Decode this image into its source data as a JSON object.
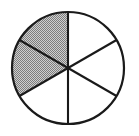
{
  "figure": {
    "name": "fraction-circle",
    "shape": "circle",
    "background_color": "#ffffff",
    "outline_color": "#1a1a1a",
    "outline_width_px": 2.2,
    "divider_color": "#1a1a1a",
    "divider_width_px": 2.1,
    "shaded_fill_color": "#a0a0a0",
    "shaded_fill_style": "dithered-checkerboard-gray",
    "unshaded_fill_color": "#ffffff"
  },
  "chart_data": {
    "type": "pie",
    "title": "",
    "subtitle": "",
    "xlabel": "",
    "ylabel": "",
    "legend_position": "none",
    "grid": false,
    "center_x": 68,
    "center_y": 68,
    "radius": 56,
    "total_sectors": 6,
    "shaded_sectors": 2,
    "unshaded_sectors": 4,
    "fraction_shaded": "2/6",
    "sector_angle_degrees": 60,
    "categories": [
      "sector-1",
      "sector-2",
      "sector-3",
      "sector-4",
      "sector-5",
      "sector-6"
    ],
    "values": [
      1,
      1,
      1,
      1,
      1,
      1
    ],
    "series": [
      {
        "name": "sectors",
        "values": [
          1,
          1,
          1,
          1,
          1,
          1
        ]
      }
    ],
    "sectors": [
      {
        "id": "sector-1",
        "position": "top-left",
        "start_angle_degrees": 90,
        "end_angle_degrees": 150,
        "shaded": true,
        "fill": "#a0a0a0"
      },
      {
        "id": "sector-2",
        "position": "left",
        "start_angle_degrees": 150,
        "end_angle_degrees": 210,
        "shaded": true,
        "fill": "#a0a0a0"
      },
      {
        "id": "sector-3",
        "position": "bottom-left",
        "start_angle_degrees": 210,
        "end_angle_degrees": 270,
        "shaded": false,
        "fill": "#ffffff"
      },
      {
        "id": "sector-4",
        "position": "bottom-right",
        "start_angle_degrees": 270,
        "end_angle_degrees": 330,
        "shaded": false,
        "fill": "#ffffff"
      },
      {
        "id": "sector-5",
        "position": "right",
        "start_angle_degrees": 330,
        "end_angle_degrees": 30,
        "shaded": false,
        "fill": "#ffffff"
      },
      {
        "id": "sector-6",
        "position": "top-right",
        "start_angle_degrees": 30,
        "end_angle_degrees": 90,
        "shaded": false,
        "fill": "#ffffff"
      }
    ],
    "dividers": [
      {
        "id": "divider-vertical",
        "angle_degrees": 90,
        "opposite_angle_degrees": 270
      },
      {
        "id": "divider-upper-left-to-lower-right",
        "angle_degrees": 150,
        "opposite_angle_degrees": 330
      },
      {
        "id": "divider-lower-left-to-upper-right",
        "angle_degrees": 210,
        "opposite_angle_degrees": 30
      }
    ]
  }
}
